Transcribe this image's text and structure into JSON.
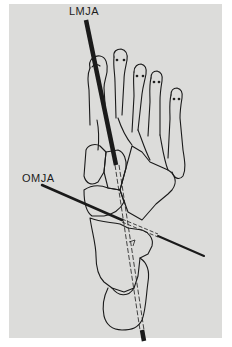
{
  "figure": {
    "background": "#dcdcda",
    "line_color": "#1a1a1a",
    "labels": {
      "lmja": "LMJA",
      "omja": "OMJA"
    },
    "axes": [
      {
        "name": "LMJA",
        "description": "longitudinal midtarsal joint axis",
        "from": [
          86,
          19
        ],
        "to": [
          150,
          341
        ]
      },
      {
        "name": "OMJA",
        "description": "oblique midtarsal joint axis",
        "from": [
          42,
          185
        ],
        "to": [
          204,
          256
        ]
      }
    ]
  }
}
